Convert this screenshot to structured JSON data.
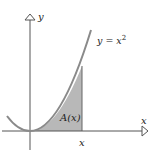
{
  "diagram": {
    "curve_label": "y = x",
    "curve_exponent": "2",
    "area_label": "A(x)",
    "x_axis_label": "x",
    "y_axis_label": "y",
    "x_tick_label": "x",
    "colors": {
      "curve": "#8a8a8a",
      "shade": "#b8b8b8",
      "axis": "#555555",
      "text": "#222222"
    }
  }
}
